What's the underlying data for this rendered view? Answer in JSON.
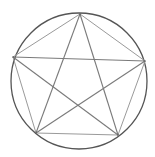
{
  "diagram": {
    "shape_vertices": [
      "top",
      "right",
      "bottom-right",
      "bottom-left",
      "left"
    ],
    "colors": {
      "background": "#ffffff",
      "circle": "#555555",
      "pentagon": "#9a9a9a",
      "pentagram": "#7a7a7a"
    }
  }
}
